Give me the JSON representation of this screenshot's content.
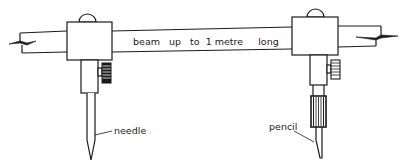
{
  "diagram": {
    "labels": {
      "beam": "beam   up   to  1 metre     long",
      "needle": "needle",
      "pencil": "pencil"
    },
    "components": [
      {
        "name": "beam",
        "description": "long straight beam with broken ends"
      },
      {
        "name": "left-clamp",
        "description": "sliding clamp block with domed top and knurled thumbscrew"
      },
      {
        "name": "right-clamp",
        "description": "sliding clamp block with domed top and knurled thumbscrew"
      },
      {
        "name": "needle",
        "description": "steel point held by left clamp"
      },
      {
        "name": "pencil",
        "description": "pencil lead held in knurled sleeve by right clamp"
      }
    ],
    "colors": {
      "line": "#1a1a1a",
      "background": "#ffffff"
    }
  }
}
